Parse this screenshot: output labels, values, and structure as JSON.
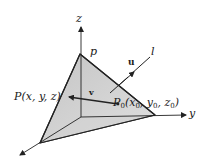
{
  "diagram": {
    "type": "3d-plane-with-line",
    "colors": {
      "plane_fill": "#cfcfcf",
      "plane_fill_light": "#e6e6e6",
      "stroke": "#222222",
      "background": "#ffffff"
    },
    "labels": {
      "z_axis": "z",
      "y_axis": "y",
      "vertex_p": "p",
      "line_l": "l",
      "vector_u": "u",
      "vector_v": "v",
      "point_P": "P(x, y, z)",
      "point_P0_main": "P",
      "point_P0_sub": "0",
      "point_P0_open": "(x",
      "point_P0_x_sub": "0",
      "point_P0_comma1": ", y",
      "point_P0_y_sub": "0",
      "point_P0_comma2": ", z",
      "point_P0_z_sub": "0",
      "point_P0_close": ")"
    }
  }
}
